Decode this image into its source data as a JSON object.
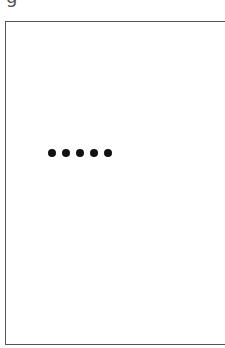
{
  "header": {
    "partial_label": "g"
  },
  "password_field": {
    "masked_value": "•••••",
    "dot_count": 5
  },
  "colors": {
    "border": "#555555",
    "dot": "#111111",
    "background": "#ffffff"
  }
}
